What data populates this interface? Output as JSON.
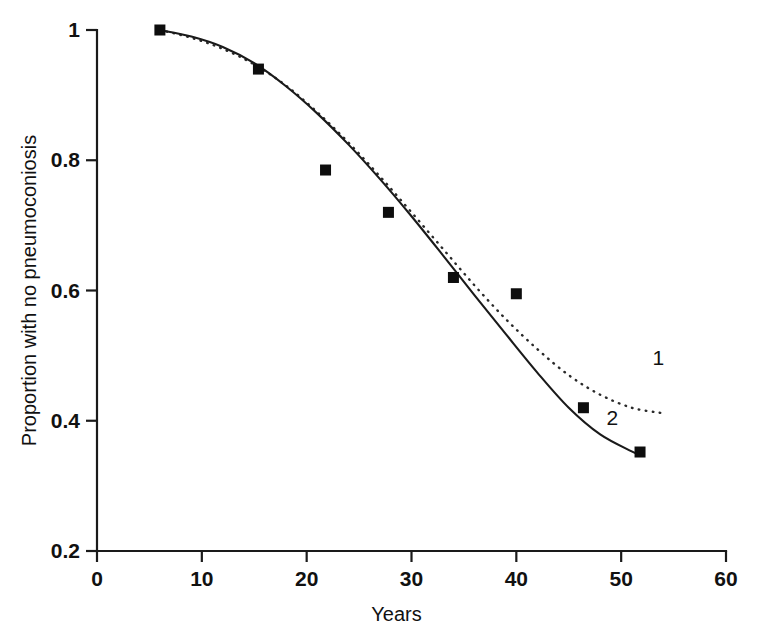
{
  "chart_data": {
    "type": "line",
    "title": "",
    "subtitle": "",
    "xlabel": "Years",
    "ylabel": "Proportion with no pneumoconiosis",
    "xlim": [
      0,
      60
    ],
    "ylim": [
      0.2,
      1.0
    ],
    "xticks": [
      "0",
      "10",
      "20",
      "30",
      "40",
      "50",
      "60"
    ],
    "xtick_values": [
      0,
      10,
      20,
      30,
      40,
      50,
      60
    ],
    "yticks": [
      "0.2",
      "0.4",
      "0.6",
      "0.8",
      "1"
    ],
    "ytick_values": [
      0.2,
      0.4,
      0.6,
      0.8,
      1.0
    ],
    "grid": false,
    "legend_position": "inline-annotation",
    "scatter": {
      "name": "Observed proportions",
      "marker": "filled-square",
      "color": "#0d0d0d",
      "points": [
        {
          "x": 6.0,
          "y": 1.0
        },
        {
          "x": 15.4,
          "y": 0.94
        },
        {
          "x": 21.8,
          "y": 0.785
        },
        {
          "x": 27.8,
          "y": 0.72
        },
        {
          "x": 34.0,
          "y": 0.62
        },
        {
          "x": 40.0,
          "y": 0.595
        },
        {
          "x": 46.4,
          "y": 0.42
        },
        {
          "x": 51.8,
          "y": 0.352
        }
      ]
    },
    "series": [
      {
        "name": "1",
        "label": "1",
        "style": "dotted",
        "color": "#2a2a2a",
        "label_x": 53.0,
        "label_y": 0.485,
        "x": [
          6.0,
          9.0,
          12.0,
          15.0,
          18.0,
          21.0,
          24.0,
          27.0,
          30.0,
          33.0,
          36.0,
          39.0,
          42.0,
          45.0,
          48.0,
          51.0,
          53.8
        ],
        "y": [
          1.0,
          0.988,
          0.971,
          0.947,
          0.915,
          0.874,
          0.827,
          0.775,
          0.72,
          0.664,
          0.608,
          0.556,
          0.51,
          0.47,
          0.44,
          0.42,
          0.412
        ]
      },
      {
        "name": "2",
        "label": "2",
        "style": "solid",
        "color": "#1a1a1a",
        "label_x": 48.6,
        "label_y": 0.393,
        "x": [
          6.0,
          9.0,
          12.0,
          15.0,
          18.0,
          21.0,
          24.0,
          27.0,
          30.0,
          33.0,
          36.0,
          39.0,
          42.0,
          45.0,
          48.0,
          51.0,
          51.9
        ],
        "y": [
          1.0,
          0.99,
          0.974,
          0.949,
          0.914,
          0.872,
          0.824,
          0.771,
          0.714,
          0.654,
          0.593,
          0.533,
          0.474,
          0.42,
          0.379,
          0.353,
          0.347
        ]
      }
    ]
  },
  "axes": {
    "y_axis_label": "Proportion with no pneumoconiosis",
    "x_axis_label": "Years",
    "ytick_labels": [
      "1",
      "0.8",
      "0.6",
      "0.4",
      "0.2"
    ],
    "xtick_labels": [
      "0",
      "10",
      "20",
      "30",
      "40",
      "50",
      "60"
    ]
  },
  "annotations": {
    "curve_one": "1",
    "curve_two": "2"
  },
  "colors": {
    "ink": "#1a1a1a",
    "marker": "#0d0d0d",
    "background": "#ffffff"
  }
}
